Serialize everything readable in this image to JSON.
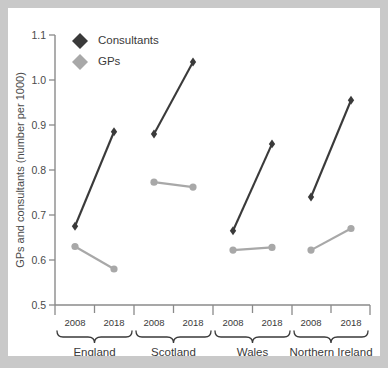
{
  "chart_data": {
    "type": "line",
    "title": "",
    "xlabel": "",
    "ylabel": "GPs and consultants (number per 1000)",
    "ylim": [
      0.5,
      1.1
    ],
    "yticks": [
      "0.5",
      "0.6",
      "0.7",
      "0.8",
      "0.9",
      "1.0",
      "1.1"
    ],
    "ytick_values": [
      0.5,
      0.6,
      0.7,
      0.8,
      0.9,
      1.0,
      1.1
    ],
    "grid": false,
    "legend_position": "top-left",
    "groups": [
      "England",
      "Scotland",
      "Wales",
      "Northern Ireland"
    ],
    "years": [
      "2008",
      "2018"
    ],
    "categories": [
      "England 2008",
      "England 2018",
      "Scotland 2008",
      "Scotland 2018",
      "Wales 2008",
      "Wales 2018",
      "Northern Ireland 2008",
      "Northern Ireland 2018"
    ],
    "series": [
      {
        "name": "Consultants",
        "color": "#3a3a3a",
        "marker": "diamond",
        "values": [
          0.675,
          0.885,
          0.88,
          1.04,
          0.665,
          0.858,
          0.74,
          0.955
        ]
      },
      {
        "name": "GPs",
        "color": "#a8a8a8",
        "marker": "circle",
        "values": [
          0.63,
          0.58,
          0.773,
          0.762,
          0.622,
          0.628,
          0.622,
          0.67
        ]
      }
    ]
  },
  "legend": {
    "items": [
      {
        "label": "Consultants",
        "color": "#3a3a3a"
      },
      {
        "label": "GPs",
        "color": "#a8a8a8"
      }
    ]
  },
  "axes": {
    "y_title": "GPs and consultants (number per 1000)",
    "y_tick_labels": [
      "1.1",
      "1.0",
      "0.9",
      "0.8",
      "0.7",
      "0.6",
      "0.5"
    ],
    "x_tick_labels": [
      "2008",
      "2018",
      "2008",
      "2018",
      "2008",
      "2018",
      "2008",
      "2018"
    ],
    "group_labels": [
      "England",
      "Scotland",
      "Wales",
      "Northern Ireland"
    ]
  }
}
